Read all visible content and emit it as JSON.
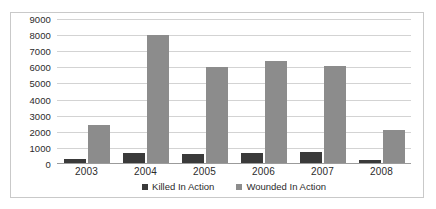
{
  "top_caption_sliver": "",
  "chart_data": {
    "type": "bar",
    "title": "",
    "xlabel": "",
    "ylabel": "",
    "categories": [
      "2003",
      "2004",
      "2005",
      "2006",
      "2007",
      "2008"
    ],
    "series": [
      {
        "name": "Killed In Action",
        "color": "#3a3a3a",
        "values": [
          300,
          700,
          650,
          700,
          750,
          250
        ]
      },
      {
        "name": "Wounded In Action",
        "color": "#8c8c8c",
        "values": [
          2400,
          8000,
          6000,
          6400,
          6100,
          2100
        ]
      }
    ],
    "ylim": [
      0,
      9000
    ],
    "ytick_labels": [
      "9000",
      "8000",
      "7000",
      "6000",
      "5000",
      "4000",
      "3000",
      "2000",
      "1000",
      "0"
    ],
    "ytick_values": [
      9000,
      8000,
      7000,
      6000,
      5000,
      4000,
      3000,
      2000,
      1000,
      0
    ],
    "grid": true,
    "legend_position": "bottom-center"
  },
  "legend": {
    "entries": [
      {
        "label": "Killed In Action"
      },
      {
        "label": "Wounded In Action"
      }
    ]
  }
}
